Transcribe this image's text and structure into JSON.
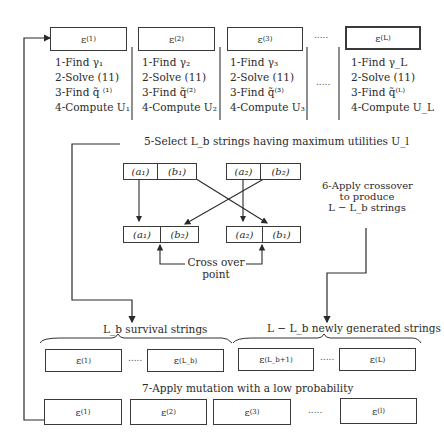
{
  "population_top": [
    {
      "label": "ε",
      "sup": "(1)",
      "steps": [
        "1-Find γ₁",
        "2-Solve (11)",
        "3-Find q̃ ⁽¹⁾",
        "4-Compute U₁"
      ]
    },
    {
      "label": "ε",
      "sup": "(2)",
      "steps": [
        "1-Find γ₂",
        "2-Solve (11)",
        "3-Find q̃⁽²⁾",
        "4-Compute U₂"
      ]
    },
    {
      "label": "ε",
      "sup": "(3)",
      "steps": [
        "1-Find γ₃",
        "2-Solve (11)",
        "3-Find q̃⁽³⁾",
        "4-Compute U₃"
      ]
    },
    {
      "label": "ε",
      "sup": "(L)",
      "steps": [
        "1-Find γ_L",
        "2-Solve (11)",
        "3-Find q̃⁽ᴸ⁾",
        "4-Compute U_L"
      ]
    }
  ],
  "ellipsis": ".....",
  "step5": "5-Select L_b strings having maximum utilities U_l",
  "step6": [
    "6-Apply crossover",
    "to produce",
    "L − L_b strings"
  ],
  "crossover": {
    "parent1": [
      "(a₁)",
      "(b₁)"
    ],
    "parent2": [
      "(a₂)",
      "(b₂)"
    ],
    "child1": [
      "(a₁)",
      "(b₂)"
    ],
    "child2": [
      "(a₂)",
      "(b₁)"
    ],
    "point_label": [
      "Cross over",
      "point"
    ]
  },
  "groups": {
    "survival": "L_b survival strings",
    "new": "L − L_b newly generated strings"
  },
  "middle_row": [
    {
      "label": "ε",
      "sup": "(1)"
    },
    {
      "label": "ε",
      "sup": "(L_b)"
    },
    {
      "label": "ε",
      "sup": "(L_b+1)"
    },
    {
      "label": "ε",
      "sup": "(L)"
    }
  ],
  "step7": "7-Apply mutation with a low probability",
  "bottom_row": [
    {
      "label": "ε",
      "sup": "(1)"
    },
    {
      "label": "ε",
      "sup": "(2)"
    },
    {
      "label": "ε",
      "sup": "(3)"
    },
    {
      "label": "ε",
      "sup": "(l)"
    }
  ]
}
